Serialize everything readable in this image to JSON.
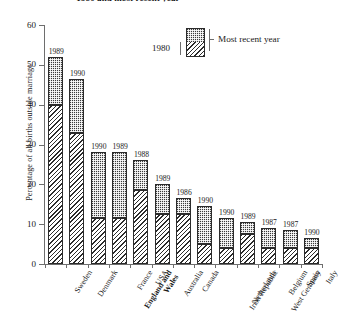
{
  "chart_data": {
    "type": "bar",
    "title": "1980 and most recent year",
    "xlabel": "",
    "ylabel": "Percentage of all births outside marriage",
    "ylim": [
      0,
      60
    ],
    "yticks": [
      0,
      10,
      20,
      30,
      40,
      50,
      60
    ],
    "grid": false,
    "stacked": true,
    "legend": {
      "position": "top-right",
      "entries": [
        {
          "name": "1980",
          "pattern": "diagonal-hatch"
        },
        {
          "name": "Most recent year",
          "pattern": "dark-stipple"
        }
      ]
    },
    "categories": [
      "Sweden",
      "Denmark",
      "England and Wales",
      "France",
      "USA",
      "Australia",
      "Canada",
      "Irish Republic",
      "Netherlands",
      "West Germany",
      "Belgium",
      "Spain",
      "Italy"
    ],
    "series": [
      {
        "name": "1980",
        "values": [
          40,
          33,
          11.5,
          11.5,
          18.5,
          12.5,
          12.5,
          5,
          4,
          7.5,
          4,
          4,
          4
        ]
      },
      {
        "name": "Most recent year",
        "values": [
          52,
          46.5,
          28,
          28,
          26,
          20,
          16.5,
          14.5,
          11.5,
          10.5,
          9,
          8.5,
          6.5
        ]
      }
    ],
    "point_labels": [
      "1989",
      "1990",
      "1990",
      "1989",
      "1988",
      "1989",
      "1986",
      "1990",
      "1990",
      "1989",
      "1987",
      "1987",
      "1990"
    ]
  },
  "axis": {
    "y_title": "Percentage of all births outside marriage",
    "y_tick_labels": [
      "60",
      "50",
      "40",
      "30",
      "20",
      "10",
      "0"
    ]
  },
  "legend": {
    "label_1980": "1980",
    "label_recent": "Most recent year"
  },
  "labels": {
    "bold_category": "England and Wales"
  }
}
